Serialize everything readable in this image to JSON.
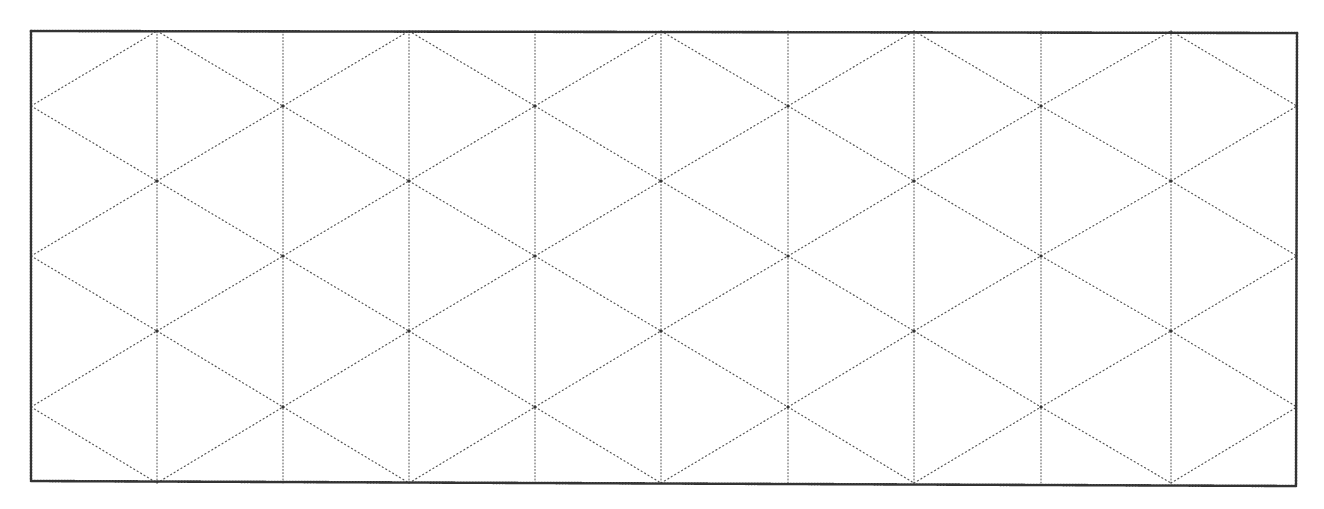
{
  "heading": {
    "text": "Isometric Dot Grid Paper (cropped)"
  },
  "grid": {
    "type": "isometric-triangle-grid",
    "border": {
      "left": 31,
      "top": 31,
      "right": 1297,
      "bottom": 483,
      "color": "#333333"
    },
    "columns_x": [
      31,
      157,
      283,
      409,
      535,
      661,
      788,
      914,
      1041,
      1171,
      1297
    ],
    "rows_y": [
      31,
      106,
      181,
      256,
      331,
      407,
      483
    ],
    "line_color": "#555555",
    "line_style": "dotted",
    "vertex_marker_color": "#333333"
  }
}
